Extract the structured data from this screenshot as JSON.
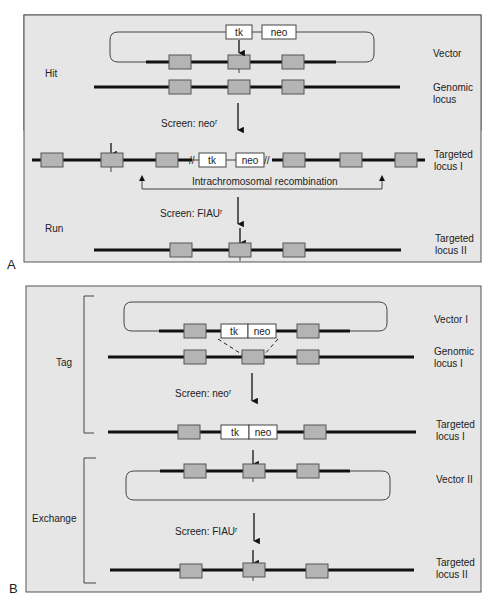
{
  "figure": {
    "panel_a": {
      "letter": "A",
      "stage_labels": {
        "hit": "Hit",
        "run": "Run"
      },
      "row_labels": {
        "vector": "Vector",
        "genomic_1": "Genomic",
        "genomic_2": "locus",
        "targeted1_1": "Targeted",
        "targeted1_2": "locus I",
        "targeted2_1": "Targeted",
        "targeted2_2": "locus II"
      },
      "cassette": {
        "tk": "tk",
        "neo": "neo"
      },
      "screens": {
        "neo": "Screen: neo",
        "fiau": "Screen: FIAU",
        "superscript": "r"
      },
      "recombination": "Intrachromosomal recombination",
      "break_mark": "//"
    },
    "panel_b": {
      "letter": "B",
      "stage_labels": {
        "tag": "Tag",
        "exchange": "Exchange"
      },
      "row_labels": {
        "vector1": "Vector I",
        "genomic_1": "Genomic",
        "genomic_2": "locus I",
        "targeted1_1": "Targeted",
        "targeted1_2": "locus I",
        "vector2": "Vector II",
        "targeted2_1": "Targeted",
        "targeted2_2": "locus II"
      },
      "cassette": {
        "tk": "tk",
        "neo": "neo"
      },
      "screens": {
        "neo": "Screen: neo",
        "fiau": "Screen: FIAU",
        "superscript": "r"
      }
    },
    "colors": {
      "panel_bg": "#e6e6e6",
      "exon": "#b4b4b4",
      "dna": "#111111",
      "cassette": "#ffffff"
    }
  }
}
